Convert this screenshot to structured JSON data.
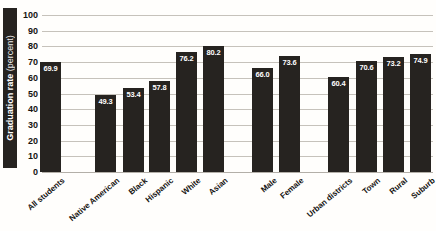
{
  "chart_data": {
    "type": "bar",
    "title": "",
    "ylabel_main": "Graduation rate",
    "ylabel_sub": " (percent)",
    "xlabel": "",
    "categories": [
      "All students",
      "Native American",
      "Black",
      "Hispanic",
      "White",
      "Asian",
      "Male",
      "Female",
      "Urban districts",
      "Town",
      "Rural",
      "Suburb"
    ],
    "values": [
      69.9,
      49.3,
      53.4,
      57.8,
      76.2,
      80.2,
      66.0,
      73.6,
      60.4,
      70.6,
      73.2,
      74.9
    ],
    "value_labels": [
      "69.9",
      "49.3",
      "53.4",
      "57.8",
      "76.2",
      "80.2",
      "66.0",
      "73.6",
      "60.4",
      "70.6",
      "73.2",
      "74.9"
    ],
    "groups": [
      [
        "All students"
      ],
      [
        "Native American",
        "Black",
        "Hispanic",
        "White",
        "Asian"
      ],
      [
        "Male",
        "Female"
      ],
      [
        "Urban districts",
        "Town",
        "Rural",
        "Suburb"
      ]
    ],
    "y_ticks": [
      100,
      90,
      80,
      70,
      60,
      50,
      40,
      30,
      20,
      10,
      0
    ],
    "ylim": [
      0,
      100
    ],
    "grid": true,
    "legend": null,
    "bar_color": "#262320",
    "value_label_color": "#ffffff",
    "gridline_color": "#c6c2bb"
  }
}
